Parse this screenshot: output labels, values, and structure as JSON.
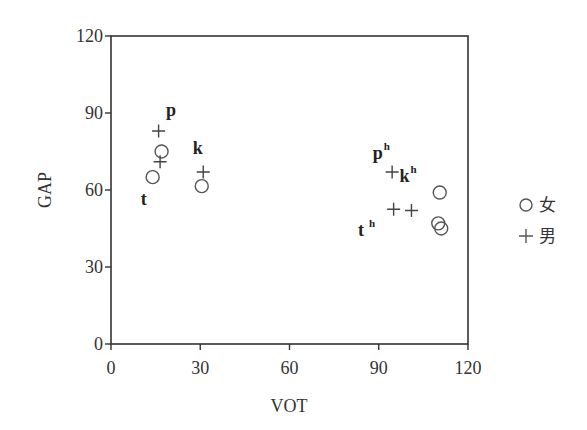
{
  "chart_data": {
    "type": "scatter",
    "title": "",
    "xlabel": "VOT",
    "ylabel": "GAP",
    "xlim": [
      0,
      120
    ],
    "ylim": [
      0,
      120
    ],
    "xticks": [
      0,
      30,
      60,
      90,
      120
    ],
    "yticks": [
      0,
      30,
      60,
      90,
      120
    ],
    "grid": false,
    "legend_position": "right",
    "series": [
      {
        "name": "女",
        "marker": "circle",
        "points": [
          {
            "x": 17,
            "y": 75,
            "label": "p"
          },
          {
            "x": 14,
            "y": 65,
            "label": "t"
          },
          {
            "x": 30.5,
            "y": 61.5,
            "label": "k"
          },
          {
            "x": 110.5,
            "y": 59,
            "label": "kʰ"
          },
          {
            "x": 110,
            "y": 47,
            "label": "pʰ"
          },
          {
            "x": 111,
            "y": 45,
            "label": "tʰ"
          }
        ]
      },
      {
        "name": "男",
        "marker": "plus",
        "points": [
          {
            "x": 16,
            "y": 83,
            "label": "p"
          },
          {
            "x": 16.5,
            "y": 71,
            "label": "t"
          },
          {
            "x": 31,
            "y": 67,
            "label": "k"
          },
          {
            "x": 94.5,
            "y": 67,
            "label": "pʰ"
          },
          {
            "x": 95,
            "y": 52.5,
            "label": "tʰ"
          },
          {
            "x": 101,
            "y": 52,
            "label": "kʰ"
          }
        ]
      }
    ],
    "annotations": [
      {
        "text": "p",
        "sup": "",
        "x": 18.5,
        "y": 89
      },
      {
        "text": "t",
        "sup": "",
        "x": 10,
        "y": 54
      },
      {
        "text": "k",
        "sup": "",
        "x": 27.5,
        "y": 74
      },
      {
        "text": "p",
        "sup": "h",
        "x": 88,
        "y": 72
      },
      {
        "text": "k",
        "sup": "h",
        "x": 97,
        "y": 63
      },
      {
        "text": "t",
        "sup": "h",
        "x": 83,
        "y": 42
      }
    ]
  },
  "legend": {
    "items": [
      {
        "symbol": "circle",
        "label": "女"
      },
      {
        "symbol": "plus",
        "label": "男"
      }
    ]
  }
}
